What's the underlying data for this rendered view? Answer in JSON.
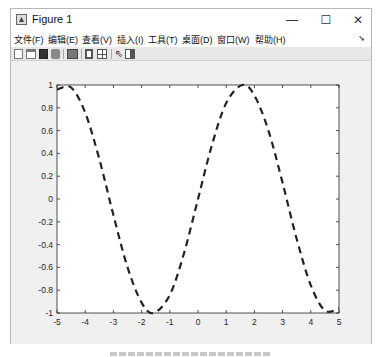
{
  "window": {
    "title": "Figure 1",
    "controls": {
      "minimize": "—",
      "maximize": "☐",
      "close": "✕"
    }
  },
  "menubar": {
    "items": [
      {
        "label": "文件(F)"
      },
      {
        "label": "编辑(E)"
      },
      {
        "label": "查看(V)"
      },
      {
        "label": "插入(I)"
      },
      {
        "label": "工具(T)"
      },
      {
        "label": "桌面(D)"
      },
      {
        "label": "窗口(W)"
      },
      {
        "label": "帮助(H)"
      }
    ],
    "overflow_arrow": "➘"
  },
  "toolbar": {
    "icons": [
      "new-figure-icon",
      "open-file-icon",
      "save-icon",
      "print-icon",
      "link-plot-icon",
      "hide-plot-tools-icon",
      "show-plot-tools-icon",
      "edit-plot-pointer-icon",
      "insert-colorbar-icon"
    ]
  },
  "chart_data": {
    "type": "line",
    "title": "",
    "xlabel": "",
    "ylabel": "",
    "xlim": [
      -5,
      5
    ],
    "ylim": [
      -1,
      1
    ],
    "xticks": [
      -5,
      -4,
      -3,
      -2,
      -1,
      0,
      1,
      2,
      3,
      4,
      5
    ],
    "xtick_labels": [
      "-5",
      "-4",
      "-3",
      "-2",
      "-1",
      "0",
      "1",
      "2",
      "3",
      "4",
      "5"
    ],
    "yticks": [
      1,
      0.8,
      0.6,
      0.4,
      0.2,
      0,
      -0.2,
      -0.4,
      -0.6,
      -0.8,
      -1
    ],
    "ytick_labels": [
      "1",
      "0.8",
      "0.6",
      "0.4",
      "0.2",
      "0",
      "-0.2",
      "-0.4",
      "-0.6",
      "-0.8",
      "-1"
    ],
    "grid": false,
    "legend": null,
    "series": [
      {
        "name": "y = sin(x)",
        "style": "dashed",
        "color": "#222222",
        "x": [
          -5,
          -4.5,
          -4,
          -3.5,
          -3,
          -2.5,
          -2,
          -1.5708,
          -1,
          -0.5,
          0,
          0.5,
          1,
          1.5708,
          2,
          2.5,
          3,
          3.5,
          4,
          4.5,
          5
        ],
        "y": [
          0.959,
          0.978,
          0.757,
          0.351,
          -0.141,
          -0.598,
          -0.909,
          -1.0,
          -0.841,
          -0.479,
          0.0,
          0.479,
          0.841,
          1.0,
          0.909,
          0.598,
          0.141,
          -0.351,
          -0.757,
          -0.978,
          -0.959
        ]
      }
    ]
  }
}
